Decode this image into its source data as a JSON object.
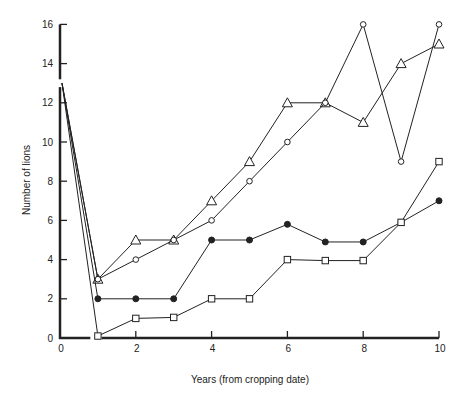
{
  "chart_data": {
    "type": "line",
    "title": "",
    "xlabel": "Years (from cropping date)",
    "ylabel": "Number of lions",
    "xlim": [
      0,
      10
    ],
    "ylim": [
      0,
      16
    ],
    "x_ticks": [
      0,
      2,
      4,
      6,
      8,
      10
    ],
    "y_ticks": [
      0,
      2,
      4,
      6,
      8,
      10,
      12,
      14,
      16
    ],
    "grid": false,
    "legend": null,
    "axis_breaks": {
      "x": [
        0.8,
        1.1
      ],
      "y": [
        12.8,
        13.2
      ]
    },
    "x": [
      0,
      1,
      2,
      3,
      4,
      5,
      6,
      7,
      8,
      9,
      10
    ],
    "series": [
      {
        "name": "open triangle",
        "marker": "triangle-open",
        "values": [
          13,
          3,
          5,
          5,
          7,
          9,
          12,
          12,
          11,
          14,
          15
        ]
      },
      {
        "name": "open circle",
        "marker": "circle-open",
        "values": [
          13,
          3,
          4,
          5,
          6,
          8,
          10,
          12,
          16,
          9,
          16
        ]
      },
      {
        "name": "filled circle",
        "marker": "circle-filled",
        "values": [
          13,
          2,
          2,
          2,
          5,
          5,
          5.8,
          4.9,
          4.9,
          5.9,
          7
        ]
      },
      {
        "name": "open square",
        "marker": "square-open",
        "values": [
          13,
          0.1,
          1,
          1.05,
          2,
          2,
          4,
          3.95,
          3.95,
          5.9,
          9
        ]
      }
    ]
  },
  "colors": {
    "line": "#222222",
    "background": "#ffffff"
  }
}
